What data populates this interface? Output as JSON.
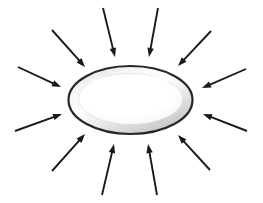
{
  "figure": {
    "background_color": "#ffffff",
    "canvas": {
      "width": 263,
      "height": 203
    }
  },
  "ellipse": {
    "name": "central-ellipse",
    "center": {
      "x": 130.5,
      "y": 100
    },
    "radius_x": 62,
    "radius_y": 34,
    "outline_color": "#262626",
    "outline_width": 2.2,
    "rim_color": "#c9c9c9",
    "rim_highlight_color": "#efefef",
    "inner_fill_color": "#ffffff",
    "inner_radius_x": 52,
    "inner_radius_y": 25
  },
  "arrows": {
    "count": 12,
    "color": "#1a1a1a",
    "stroke_width": 1.9,
    "head_length": 9,
    "head_width": 6.5,
    "items": [
      {
        "name": "arrow-top-left-inner",
        "tail": {
          "x": 103,
          "y": 8
        },
        "tip": {
          "x": 115,
          "y": 57
        }
      },
      {
        "name": "arrow-top-right-inner",
        "tail": {
          "x": 158,
          "y": 8
        },
        "tip": {
          "x": 149,
          "y": 57
        }
      },
      {
        "name": "arrow-top-left-outer",
        "tail": {
          "x": 52,
          "y": 30
        },
        "tip": {
          "x": 85,
          "y": 67
        }
      },
      {
        "name": "arrow-top-right-outer",
        "tail": {
          "x": 211,
          "y": 31
        },
        "tip": {
          "x": 178,
          "y": 66
        }
      },
      {
        "name": "arrow-left-upper",
        "tail": {
          "x": 18,
          "y": 67
        },
        "tip": {
          "x": 61,
          "y": 87
        }
      },
      {
        "name": "arrow-right-upper",
        "tail": {
          "x": 246,
          "y": 69
        },
        "tip": {
          "x": 202,
          "y": 88
        }
      },
      {
        "name": "arrow-left-lower",
        "tail": {
          "x": 15,
          "y": 131
        },
        "tip": {
          "x": 62,
          "y": 114
        }
      },
      {
        "name": "arrow-right-lower",
        "tail": {
          "x": 247,
          "y": 131
        },
        "tip": {
          "x": 203,
          "y": 114
        }
      },
      {
        "name": "arrow-bottom-left-outer",
        "tail": {
          "x": 52,
          "y": 171
        },
        "tip": {
          "x": 85,
          "y": 134
        }
      },
      {
        "name": "arrow-bottom-right-outer",
        "tail": {
          "x": 210,
          "y": 170
        },
        "tip": {
          "x": 178,
          "y": 135
        }
      },
      {
        "name": "arrow-bottom-left-inner",
        "tail": {
          "x": 102,
          "y": 195
        },
        "tip": {
          "x": 114,
          "y": 144
        }
      },
      {
        "name": "arrow-bottom-right-inner",
        "tail": {
          "x": 157,
          "y": 195
        },
        "tip": {
          "x": 148,
          "y": 144
        }
      }
    ]
  }
}
